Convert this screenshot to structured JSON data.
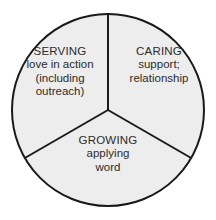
{
  "diagram": {
    "type": "three-sector-circle",
    "style": {
      "background_color": "#ffffff",
      "sector_fill_color": "#ededed",
      "stroke_color": "#1a1a1a",
      "text_color": "#2b2b2b",
      "stroke_width": 2
    },
    "geometry": {
      "center_x": 108,
      "center_y": 110,
      "radius": 96,
      "sector_count": 3,
      "sector_angle_degrees": 120,
      "first_divider_angle_degrees": 90
    },
    "sectors": [
      {
        "id": "serving",
        "position": "upper-left",
        "title": "SERVING",
        "lines": [
          "love in action",
          "(including",
          "outreach)"
        ]
      },
      {
        "id": "caring",
        "position": "upper-right",
        "title": "CARING",
        "lines": [
          "support;",
          "relationship"
        ]
      },
      {
        "id": "growing",
        "position": "bottom",
        "title": "GROWING",
        "lines": [
          "applying",
          "word"
        ]
      }
    ]
  }
}
